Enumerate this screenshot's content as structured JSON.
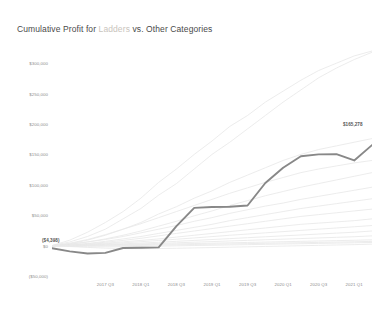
{
  "title": {
    "prefix": "Cumulative Profit for ",
    "highlight": "Ladders",
    "suffix": " vs. Other Categories"
  },
  "colors": {
    "highlight_line": "#888888",
    "other_lines": "#e8e8e8",
    "axis_text": "#8d8d8d",
    "title_text": "#4a4a4a",
    "highlight_text": "#c9c4bd",
    "background": "#ffffff"
  },
  "annotations": {
    "start_value": "($4,398)",
    "end_value": "$165,278"
  },
  "chart_data": {
    "type": "line",
    "title": "Cumulative Profit for Ladders vs. Other Categories",
    "xlabel": "",
    "ylabel": "",
    "grid": false,
    "legend": "none",
    "ylim": [
      -50000,
      325000
    ],
    "y_ticks": [
      300000,
      250000,
      200000,
      150000,
      100000,
      50000,
      0,
      -50000
    ],
    "y_tick_labels": [
      "$300,000",
      "$250,000",
      "$200,000",
      "$150,000",
      "$100,000",
      "$50,000",
      "$0",
      "($50,000)"
    ],
    "x_tick_labels": [
      "2017 Q3",
      "2018 Q1",
      "2018 Q3",
      "2019 Q1",
      "2019 Q3",
      "2020 Q1",
      "2020 Q3",
      "2021 Q1"
    ],
    "x_tick_positions": [
      3,
      5,
      7,
      9,
      11,
      13,
      15,
      17
    ],
    "x": [
      0,
      1,
      2,
      3,
      4,
      5,
      6,
      7,
      8,
      9,
      10,
      11,
      12,
      13,
      14,
      15,
      16,
      17,
      18
    ],
    "highlight_series": {
      "name": "Ladders",
      "start_label": "($4,398)",
      "end_label": "$165,278",
      "values": [
        -4398,
        -9500,
        -13000,
        -12000,
        -4000,
        -3500,
        -3000,
        32000,
        62000,
        63500,
        64000,
        66000,
        103000,
        128000,
        147000,
        150000,
        150500,
        140000,
        165278
      ]
    },
    "other_series": [
      {
        "name": "Other category 1",
        "values": [
          0,
          9000,
          22000,
          38000,
          56000,
          78000,
          104000,
          126000,
          150000,
          172000,
          196000,
          214000,
          236000,
          254000,
          272000,
          288000,
          300000,
          312000,
          320000
        ]
      },
      {
        "name": "Other category 2",
        "values": [
          0,
          6000,
          15000,
          27000,
          44000,
          61000,
          83000,
          102000,
          126000,
          150000,
          170000,
          192000,
          214000,
          236000,
          256000,
          276000,
          292000,
          306000,
          318000
        ]
      },
      {
        "name": "Other category 3",
        "values": [
          -1000,
          3000,
          9000,
          17000,
          27000,
          38000,
          52000,
          64000,
          78000,
          90000,
          104000,
          116000,
          128000,
          140000,
          150000,
          158000,
          164000,
          170000,
          176000
        ]
      },
      {
        "name": "Other category 4",
        "values": [
          0,
          4000,
          10000,
          18000,
          27000,
          36000,
          46000,
          56000,
          66000,
          76000,
          86000,
          95000,
          104000,
          112000,
          120000,
          126000,
          131000,
          136000,
          140000
        ]
      },
      {
        "name": "Other category 5",
        "values": [
          -500,
          2000,
          6000,
          11000,
          17000,
          24000,
          32000,
          40000,
          49000,
          57000,
          66000,
          74000,
          82000,
          89000,
          96000,
          102000,
          108000,
          114000,
          120000
        ]
      },
      {
        "name": "Other category 6",
        "values": [
          0,
          2500,
          6000,
          10000,
          15000,
          21000,
          27000,
          33000,
          40000,
          46000,
          53000,
          59000,
          65000,
          70000,
          76000,
          81000,
          86000,
          91000,
          96000
        ]
      },
      {
        "name": "Other category 7",
        "values": [
          -800,
          1000,
          3500,
          7000,
          11000,
          15000,
          20000,
          25000,
          30000,
          35000,
          41000,
          46000,
          51000,
          56000,
          61000,
          65000,
          69000,
          73000,
          77000
        ]
      },
      {
        "name": "Other category 8",
        "values": [
          0,
          1200,
          3000,
          5500,
          8500,
          12000,
          16000,
          20000,
          24000,
          28000,
          32000,
          36000,
          40000,
          44000,
          48000,
          51000,
          54000,
          57000,
          60000
        ]
      },
      {
        "name": "Other category 9",
        "values": [
          -300,
          800,
          2200,
          4000,
          6200,
          8500,
          11000,
          14000,
          17000,
          20000,
          23000,
          26000,
          29000,
          32000,
          35000,
          37000,
          39000,
          41000,
          44000
        ]
      },
      {
        "name": "Other category 10",
        "values": [
          0,
          600,
          1600,
          3000,
          4600,
          6400,
          8400,
          10500,
          12600,
          14800,
          17000,
          19000,
          21000,
          23000,
          25000,
          27000,
          29000,
          31000,
          33000
        ]
      },
      {
        "name": "Other category 11",
        "values": [
          -200,
          300,
          1000,
          1900,
          3000,
          4200,
          5500,
          7000,
          8500,
          10000,
          11500,
          13000,
          14500,
          16000,
          17500,
          19000,
          20500,
          22000,
          24000
        ]
      },
      {
        "name": "Other category 12",
        "values": [
          0,
          200,
          600,
          1200,
          1900,
          2700,
          3600,
          4600,
          5600,
          6600,
          7600,
          8600,
          9600,
          10600,
          11600,
          12600,
          13600,
          14600,
          16000
        ]
      },
      {
        "name": "Other category 13",
        "values": [
          -400,
          -200,
          200,
          600,
          1100,
          1600,
          2200,
          2800,
          3400,
          4000,
          4600,
          5200,
          5800,
          6400,
          7000,
          7600,
          8200,
          8800,
          9500
        ]
      },
      {
        "name": "Other category 14",
        "values": [
          0,
          -300,
          -500,
          -400,
          -100,
          300,
          800,
          1300,
          1800,
          2300,
          2800,
          3300,
          3800,
          4300,
          4800,
          5300,
          5800,
          6300,
          7000
        ]
      },
      {
        "name": "Other category 15",
        "values": [
          -600,
          -1200,
          -1800,
          -2000,
          -1800,
          -1400,
          -900,
          -400,
          100,
          600,
          1100,
          1600,
          2100,
          2600,
          3100,
          3600,
          4100,
          4600,
          5200
        ]
      },
      {
        "name": "Other category 16",
        "values": [
          0,
          -1500,
          -3000,
          -4200,
          -4800,
          -5000,
          -4800,
          -4400,
          -3800,
          -3200,
          -2600,
          -2000,
          -1400,
          -800,
          -200,
          400,
          1000,
          1600,
          2400
        ]
      }
    ]
  }
}
